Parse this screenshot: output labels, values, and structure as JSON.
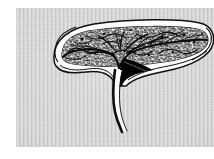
{
  "image": {
    "kind": "scanned-line-illustration",
    "subject": "elongated bilobed organ in longitudinal section with branching vascular stalk",
    "caption": "",
    "canvas": {
      "width": 214,
      "height": 159
    },
    "background_color": "#ffffff"
  },
  "panel": {
    "name": "scan-panel",
    "x": 16,
    "y": 8,
    "width": 198,
    "height": 139,
    "fill_color": "#cfcfcf",
    "texture": "vertical-scanline-striping"
  },
  "figure": {
    "ink_color": "#0d0d0d",
    "paper_color": "#ffffff",
    "parts": [
      {
        "id": "body-outer-wall",
        "label": "outer capsule wall",
        "color": "#ffffff",
        "stroke": "#111111"
      },
      {
        "id": "body-inner-cavity",
        "label": "inner cavity",
        "color": "#ffffff",
        "stroke": "#111111"
      },
      {
        "id": "medulla-texture",
        "label": "stippled medullary tissue",
        "color": "#141414",
        "stroke": "#141414"
      },
      {
        "id": "vessel-tree",
        "label": "branching vessel tree",
        "color": "#0d0d0d",
        "stroke": "#0d0d0d"
      },
      {
        "id": "black-crescent",
        "label": "solid crescent shadow",
        "color": "#000000",
        "stroke": "#000000"
      },
      {
        "id": "stalk",
        "label": "descending stalk",
        "color": "#ffffff",
        "stroke": "#0d0d0d"
      },
      {
        "id": "left-tip",
        "label": "rounded left pole",
        "color": "#ffffff",
        "stroke": "#111111"
      },
      {
        "id": "right-tip",
        "label": "rounded right pole",
        "color": "#ffffff",
        "stroke": "#111111"
      }
    ],
    "geometry": {
      "body_left_x": 38,
      "body_right_x": 198,
      "body_top_y": 20,
      "body_bottom_y": 72,
      "stalk_top_y": 48,
      "stalk_bottom_y": 120,
      "stalk_x": 103
    }
  },
  "chart_data": null
}
